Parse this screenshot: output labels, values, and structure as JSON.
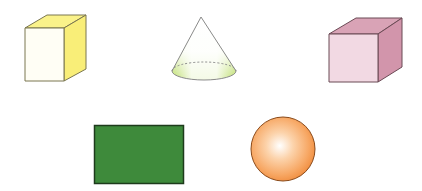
{
  "figure": {
    "shapes": [
      {
        "name": "cube",
        "colors": {
          "front": "#fffef5",
          "top": "#faf28a",
          "side": "#f9ee78",
          "stroke": "#7a7650"
        }
      },
      {
        "name": "cone",
        "colors": {
          "body": "#ffffff",
          "base_tint": "#b9dc63",
          "stroke": "#8a8a8a"
        }
      },
      {
        "name": "cube",
        "colors": {
          "front": "#f2d9e3",
          "top": "#d9a3b6",
          "side": "#d295ab",
          "stroke": "#6b4a55"
        }
      },
      {
        "name": "rectangle",
        "colors": {
          "fill": "#3e8a3b",
          "stroke": "#1e3b1c"
        }
      },
      {
        "name": "sphere",
        "colors": {
          "highlight": "#ffffff",
          "mid": "#f9b578",
          "edge": "#f08a3a",
          "stroke": "#8a4a1a"
        }
      }
    ]
  }
}
